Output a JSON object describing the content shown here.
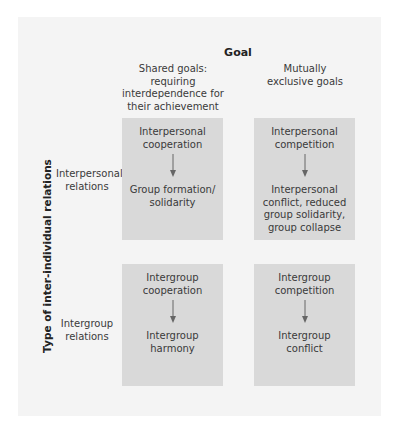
{
  "diagram": {
    "goal_title": "Goal",
    "columns": [
      {
        "label": "Shared goals:\nrequiring\ninterdependence for\ntheir achievement"
      },
      {
        "label": "Mutually\nexclusive goals"
      }
    ],
    "axis_label": "Type of inter-individual relations",
    "rows": [
      {
        "label": "Interpersonal\nrelations"
      },
      {
        "label": "Intergroup\nrelations"
      }
    ],
    "cells": {
      "interpersonal_shared": {
        "cause": "Interpersonal\ncooperation",
        "effect": "Group formation/\nsolidarity"
      },
      "interpersonal_exclusive": {
        "cause": "Interpersonal\ncompetition",
        "effect": "Interpersonal\nconflict, reduced\ngroup solidarity,\ngroup collapse"
      },
      "intergroup_shared": {
        "cause": "Intergroup\ncooperation",
        "effect": "Intergroup\nharmony"
      },
      "intergroup_exclusive": {
        "cause": "Intergroup\ncompetition",
        "effect": "Intergroup\nconflict"
      }
    },
    "icons": {
      "arrow": "arrow-down-icon"
    },
    "colors": {
      "panel_background": "#f4f4f4",
      "cell_background": "#d9d9d9",
      "arrow": "#666666",
      "text": "#3a3a3a"
    }
  }
}
